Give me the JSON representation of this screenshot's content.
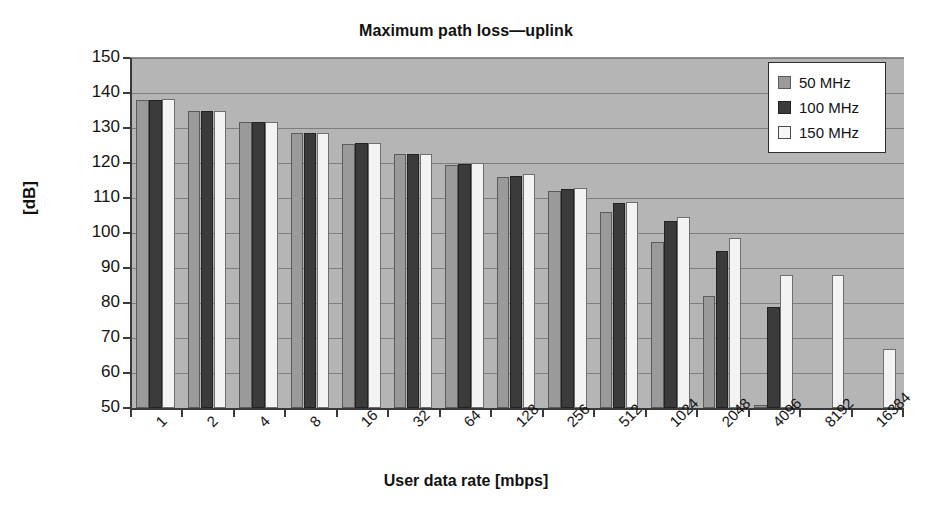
{
  "chart_data": {
    "type": "bar",
    "title": "Maximum path loss—uplink",
    "xlabel": "User data rate [mbps]",
    "ylabel": "[dB]",
    "categories": [
      "1",
      "2",
      "4",
      "8",
      "16",
      "32",
      "64",
      "128",
      "256",
      "512",
      "1024",
      "2048",
      "4096",
      "8192",
      "16384"
    ],
    "series": [
      {
        "name": "50 MHz",
        "color": "#9a9a9a",
        "values": [
          138,
          135,
          131.8,
          128.5,
          125.5,
          122.5,
          119.5,
          116,
          112,
          106,
          97.5,
          82,
          51,
          null,
          null
        ]
      },
      {
        "name": "100 MHz",
        "color": "#3b3b3b",
        "values": [
          138,
          135,
          131.8,
          128.5,
          125.8,
          122.5,
          119.8,
          116.3,
          112.5,
          108.5,
          103.5,
          95,
          79,
          null,
          null
        ]
      },
      {
        "name": "150 MHz",
        "color": "#f3f3f3",
        "values": [
          138.3,
          135,
          131.8,
          128.5,
          125.8,
          122.7,
          120,
          117,
          113,
          109,
          104.5,
          98.5,
          88,
          88,
          67
        ]
      }
    ],
    "ylim": [
      50,
      150
    ],
    "yticks": [
      150,
      140,
      130,
      120,
      110,
      100,
      90,
      80,
      70,
      60,
      50
    ],
    "ytick_labels": [
      "150",
      "140",
      "130",
      "120",
      "110",
      "100",
      "90",
      "80",
      "70",
      "60",
      "50"
    ],
    "grid": true,
    "grid_axis": "y",
    "legend_position": "top-right",
    "plot_background": "#b5b5b5",
    "figure_background": "#ffffff"
  },
  "legend": {
    "items": [
      {
        "label": "50 MHz"
      },
      {
        "label": "100 MHz"
      },
      {
        "label": "150 MHz"
      }
    ]
  }
}
